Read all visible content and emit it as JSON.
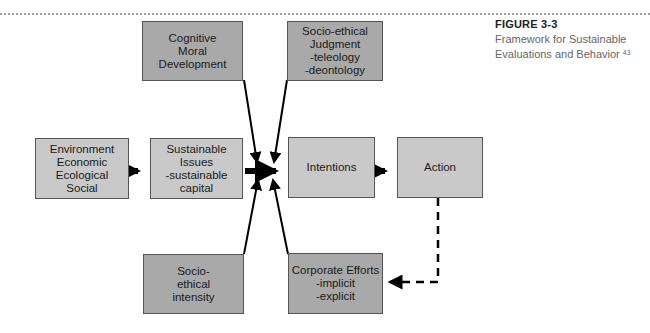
{
  "caption": {
    "figure_label": "FIGURE 3-3",
    "title_line1": "Framework for Sustainable",
    "title_line2": "Evaluations and Behavior",
    "footnote": "43"
  },
  "boxes": {
    "cognitive": {
      "lines": [
        "Cognitive",
        "Moral",
        "Development"
      ]
    },
    "judgment": {
      "lines": [
        "Socio-ethical",
        "Judgment",
        "-teleology",
        "-deontology"
      ]
    },
    "environment": {
      "lines": [
        "Environment",
        "Economic",
        "Ecological",
        "Social"
      ]
    },
    "sustainable": {
      "lines": [
        "Sustainable",
        "Issues",
        "-sustainable",
        "capital"
      ]
    },
    "intentions": {
      "lines": [
        "Intentions"
      ]
    },
    "action": {
      "lines": [
        "Action"
      ]
    },
    "intensity": {
      "lines": [
        "Socio-",
        "ethical",
        "intensity"
      ]
    },
    "corporate": {
      "lines": [
        "Corporate Efforts",
        "-implicit",
        "-explicit"
      ]
    }
  },
  "colors": {
    "dark_box": "#a9a9a9",
    "light_box": "#c9c9c9",
    "arrow": "#000000"
  }
}
